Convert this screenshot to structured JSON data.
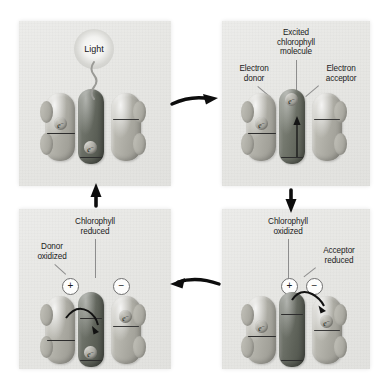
{
  "diagram": {
    "background_color": "#ffffff",
    "panel_color": "#e9e9e6",
    "arrow_color": "#111111",
    "layout": "2x2 cycle, clockwise"
  },
  "panels": {
    "top_left": {
      "name": "light absorption",
      "light_label": "Light",
      "molecules": {
        "donor": {
          "electron": "e",
          "charge_sup": "−"
        },
        "chlorophyll": {
          "electron": "e",
          "charge_sup": "−"
        },
        "acceptor": {}
      }
    },
    "top_right": {
      "name": "excited chlorophyll",
      "labels": {
        "center": "Excited\nchlorophyll\nmolecule",
        "left": "Electron\ndonor",
        "right": "Electron\nacceptor"
      },
      "molecules": {
        "donor": {
          "electron": "e",
          "charge_sup": "−"
        },
        "chlorophyll": {
          "electron": "e",
          "charge_sup": "−"
        },
        "acceptor": {}
      }
    },
    "bottom_right": {
      "name": "chlorophyll oxidized, acceptor reduced",
      "labels": {
        "center": "Chlorophyll\noxidized",
        "right": "Acceptor\nreduced"
      },
      "badges": {
        "center": "+",
        "right": "−"
      },
      "molecules": {
        "donor": {
          "electron": "e",
          "charge_sup": "−"
        },
        "acceptor": {
          "electron": "e",
          "charge_sup": "−"
        }
      }
    },
    "bottom_left": {
      "name": "donor oxidized, chlorophyll reduced",
      "labels": {
        "center": "Chlorophyll\nreduced",
        "left": "Donor\noxidized"
      },
      "badges": {
        "left": "+",
        "right": "−"
      },
      "molecules": {
        "chlorophyll": {
          "electron": "e",
          "charge_sup": "−"
        },
        "acceptor": {
          "electron": "e",
          "charge_sup": "−"
        }
      }
    }
  },
  "arrows": [
    {
      "name": "arrow-top-left-to-top-right",
      "direction": "right"
    },
    {
      "name": "arrow-top-right-to-bottom-right",
      "direction": "down"
    },
    {
      "name": "arrow-bottom-right-to-bottom-left",
      "direction": "left"
    },
    {
      "name": "arrow-bottom-left-to-top-left",
      "direction": "up"
    }
  ]
}
